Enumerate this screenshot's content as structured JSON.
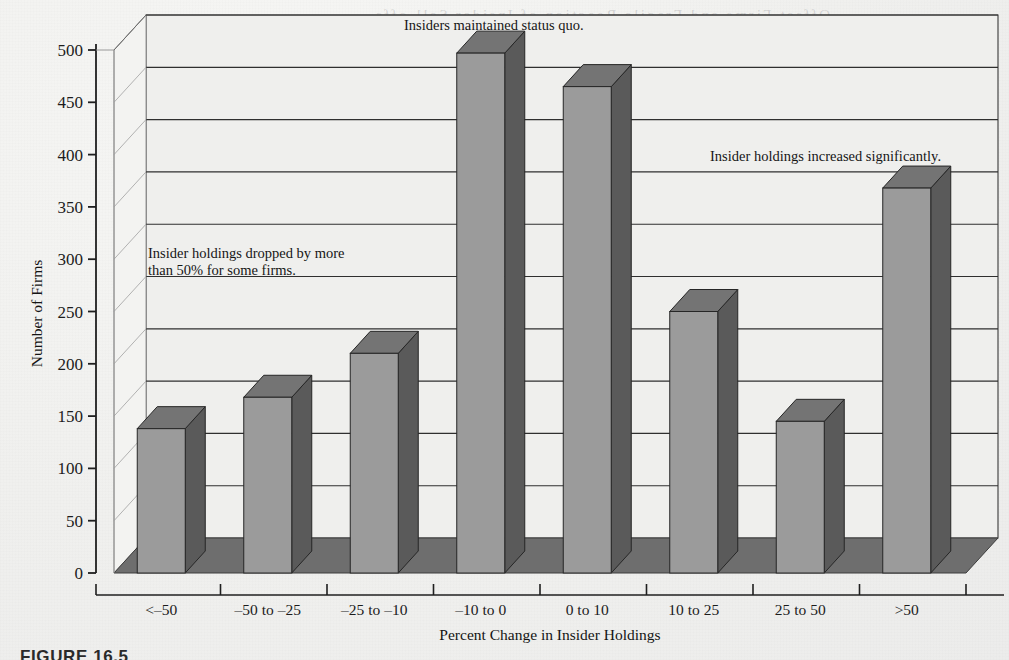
{
  "figure": {
    "caption": "FIGURE 16.5",
    "bleed_through_text": "Offset Firms and Fragile Reaction of Insider Sell-offs"
  },
  "chart_data": {
    "type": "bar",
    "title": "",
    "xlabel": "Percent Change in Insider Holdings",
    "ylabel": "Number of Firms",
    "categories": [
      "<–50",
      "–50 to –25",
      "–25 to –10",
      "–10 to 0",
      "0 to 10",
      "10 to 25",
      "25 to 50",
      ">50"
    ],
    "values": [
      138,
      168,
      210,
      497,
      465,
      250,
      145,
      368
    ],
    "ylim": [
      0,
      500
    ],
    "yticks": [
      0,
      50,
      100,
      150,
      200,
      250,
      300,
      350,
      400,
      450,
      500
    ],
    "ytick_labels": [
      "0",
      "50",
      "100",
      "150",
      "200",
      "250",
      "300",
      "350",
      "400",
      "450",
      "500"
    ],
    "grid": true,
    "legend": "none",
    "style": "3d-perspective-bars",
    "annotations": [
      {
        "id": "annot-drop",
        "lines": [
          "Insider holdings dropped by more",
          "than 50% for some firms."
        ],
        "x": 148,
        "y": 258
      },
      {
        "id": "annot-status-quo",
        "lines": [
          "Insiders maintained status quo."
        ],
        "x": 404,
        "y": 30
      },
      {
        "id": "annot-increase",
        "lines": [
          "Insider holdings increased significantly."
        ],
        "x": 710,
        "y": 161
      }
    ]
  },
  "colors": {
    "bar_front": "#9b9b9b",
    "bar_side": "#5a5a5a",
    "bar_top": "#747474",
    "floor": "#6e6e6e",
    "wall": "#efefed",
    "gridline": "#2f2f2f",
    "axis": "#1f1f1f",
    "page": "#f0f0ee"
  }
}
